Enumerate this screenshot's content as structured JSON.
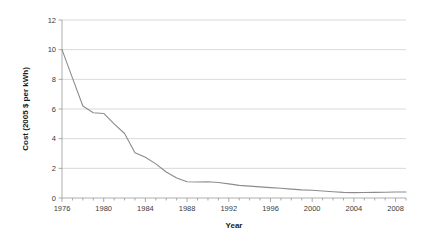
{
  "chart_data": {
    "type": "line",
    "title": "",
    "xlabel": "Year",
    "ylabel": "Cost (2005 $ per kWh)",
    "xlim": [
      1976,
      2009
    ],
    "ylim": [
      0,
      12
    ],
    "grid": "horizontal",
    "legend": "none",
    "x_tick_labels": [
      "1976",
      "1980",
      "1984",
      "1988",
      "1992",
      "1996",
      "2000",
      "2004",
      "2008"
    ],
    "x_tick_values": [
      1976,
      1980,
      1984,
      1988,
      1992,
      1996,
      2000,
      2004,
      2008
    ],
    "x_minor_tick_step": 1,
    "y_tick_labels": [
      "0",
      "2",
      "4",
      "6",
      "8",
      "10",
      "12"
    ],
    "y_tick_values": [
      0,
      2,
      4,
      6,
      8,
      10,
      12
    ],
    "series": [
      {
        "name": "Cost",
        "color": "#8c8c8c",
        "x": [
          1976,
          1977,
          1978,
          1979,
          1980,
          1981,
          1982,
          1983,
          1984,
          1985,
          1986,
          1987,
          1988,
          1989,
          1990,
          1991,
          1992,
          1993,
          1994,
          1995,
          1996,
          1997,
          1998,
          1999,
          2000,
          2001,
          2002,
          2003,
          2004,
          2005,
          2006,
          2007,
          2008,
          2009
        ],
        "values": [
          10.0,
          8.1,
          6.2,
          5.75,
          5.7,
          5.0,
          4.35,
          3.05,
          2.75,
          2.3,
          1.75,
          1.35,
          1.1,
          1.08,
          1.1,
          1.05,
          0.95,
          0.85,
          0.8,
          0.75,
          0.7,
          0.66,
          0.6,
          0.55,
          0.52,
          0.47,
          0.42,
          0.38,
          0.36,
          0.37,
          0.38,
          0.39,
          0.4,
          0.4
        ]
      }
    ]
  },
  "colors": {
    "gridline": "#c8c8c8",
    "axis": "#9a9a9a",
    "data_line": "#8c8c8c",
    "text": "#3a3a3a",
    "background": "#ffffff"
  }
}
